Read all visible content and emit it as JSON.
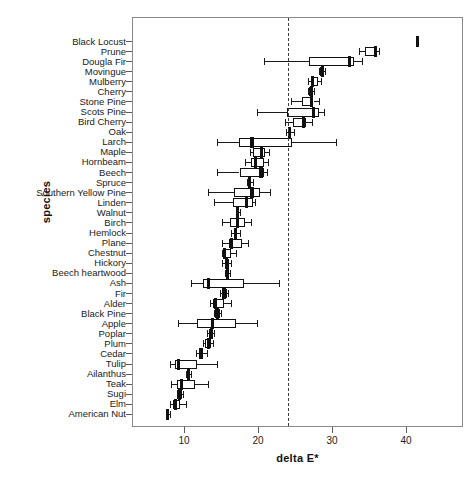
{
  "chart_data": {
    "type": "boxplot",
    "title": "",
    "xlabel": "delta E*",
    "ylabel": "species",
    "xlim": [
      6,
      45.5
    ],
    "xticks": [
      10,
      20,
      30,
      40
    ],
    "xticklabels": [
      "10",
      "20",
      "30",
      "40"
    ],
    "grid": false,
    "legend": null,
    "reference_line": {
      "value": 24,
      "style": "dashed",
      "orientation": "vertical"
    },
    "orientation": "horizontal",
    "categories": [
      "Black Locust",
      "Prune",
      "Dougla Fir",
      "Movingue",
      "Mulberry",
      "Cherry",
      "Stone Pine",
      "Scots Pine",
      "Bird Cherry",
      "Oak",
      "Larch",
      "Maple",
      "Hornbeam",
      "Beech",
      "Spruce",
      "Southern Yellow Pine",
      "Linden",
      "Walnut",
      "Birch",
      "Hemlock",
      "Plane",
      "Chestnut",
      "Hickory",
      "Beech heartwood",
      "Ash",
      "Fir",
      "Alder",
      "Black Pine",
      "Apple",
      "Poplar",
      "Plum",
      "Cedar",
      "Tulip",
      "Ailanthus",
      "Teak",
      "Sugi",
      "Elm",
      "American Nut"
    ],
    "boxes": [
      {
        "species": "Black Locust",
        "whisker_low": 41.3,
        "q1": 41.3,
        "median": 41.5,
        "q3": 41.8,
        "whisker_high": 41.8
      },
      {
        "species": "Prune",
        "whisker_low": 33.6,
        "q1": 34.4,
        "median": 35.9,
        "q3": 36.1,
        "whisker_high": 36.3
      },
      {
        "species": "Dougla Fir",
        "whisker_low": 20.8,
        "q1": 26.9,
        "median": 32.4,
        "q3": 33.0,
        "whisker_high": 34.1
      },
      {
        "species": "Movingue",
        "whisker_low": 28.2,
        "q1": 28.4,
        "median": 28.7,
        "q3": 28.9,
        "whisker_high": 29.0
      },
      {
        "species": "Mulberry",
        "whisker_low": 26.8,
        "q1": 27.2,
        "median": 27.4,
        "q3": 28.1,
        "whisker_high": 28.5
      },
      {
        "species": "Cherry",
        "whisker_low": 26.8,
        "q1": 26.9,
        "median": 27.2,
        "q3": 27.4,
        "whisker_high": 27.5
      },
      {
        "species": "Stone Pine",
        "whisker_low": 24.5,
        "q1": 25.9,
        "median": 27.2,
        "q3": 27.5,
        "whisker_high": 28.2
      },
      {
        "species": "Scots Pine",
        "whisker_low": 19.8,
        "q1": 23.9,
        "median": 27.5,
        "q3": 28.2,
        "whisker_high": 28.9
      },
      {
        "species": "Bird Cherry",
        "whisker_low": 23.7,
        "q1": 24.7,
        "median": 26.1,
        "q3": 26.5,
        "whisker_high": 27.3
      },
      {
        "species": "Oak",
        "whisker_low": 23.8,
        "q1": 24.0,
        "median": 24.3,
        "q3": 24.5,
        "whisker_high": 24.9
      },
      {
        "species": "Larch",
        "whisker_low": 14.5,
        "q1": 17.4,
        "median": 19.2,
        "q3": 24.6,
        "whisker_high": 30.6
      },
      {
        "species": "Maple",
        "whisker_low": 18.9,
        "q1": 19.3,
        "median": 20.5,
        "q3": 20.9,
        "whisker_high": 21.5
      },
      {
        "species": "Hornbeam",
        "whisker_low": 18.3,
        "q1": 19.0,
        "median": 19.7,
        "q3": 20.8,
        "whisker_high": 21.3
      },
      {
        "species": "Beech",
        "whisker_low": 14.4,
        "q1": 17.5,
        "median": 20.4,
        "q3": 20.8,
        "whisker_high": 21.2
      },
      {
        "species": "Spruce",
        "whisker_low": 18.5,
        "q1": 18.7,
        "median": 18.9,
        "q3": 19.1,
        "whisker_high": 19.3
      },
      {
        "species": "Southern Yellow Pine",
        "whisker_low": 13.2,
        "q1": 16.7,
        "median": 19.2,
        "q3": 20.3,
        "whisker_high": 21.6
      },
      {
        "species": "Linden",
        "whisker_low": 14.0,
        "q1": 16.6,
        "median": 18.5,
        "q3": 19.3,
        "whisker_high": 19.6
      },
      {
        "species": "Walnut",
        "whisker_low": 17.0,
        "q1": 17.0,
        "median": 17.2,
        "q3": 17.4,
        "whisker_high": 17.5
      },
      {
        "species": "Birch",
        "whisker_low": 15.1,
        "q1": 16.2,
        "median": 17.2,
        "q3": 18.2,
        "whisker_high": 19.0
      },
      {
        "species": "Hemlock",
        "whisker_low": 16.4,
        "q1": 16.7,
        "median": 17.0,
        "q3": 17.2,
        "whisker_high": 17.6
      },
      {
        "species": "Plane",
        "whisker_low": 15.2,
        "q1": 16.1,
        "median": 16.4,
        "q3": 17.9,
        "whisker_high": 18.6
      },
      {
        "species": "Chestnut",
        "whisker_low": 15.1,
        "q1": 15.3,
        "median": 15.5,
        "q3": 16.3,
        "whisker_high": 17.0
      },
      {
        "species": "Hickory",
        "whisker_low": 15.1,
        "q1": 15.5,
        "median": 15.7,
        "q3": 16.1,
        "whisker_high": 16.3
      },
      {
        "species": "Beech heartwood",
        "whisker_low": 15.6,
        "q1": 15.7,
        "median": 15.9,
        "q3": 16.1,
        "whisker_high": 16.2
      },
      {
        "species": "Ash",
        "whisker_low": 11.0,
        "q1": 12.6,
        "median": 13.3,
        "q3": 18.1,
        "whisker_high": 22.8
      },
      {
        "species": "Fir",
        "whisker_low": 14.9,
        "q1": 15.2,
        "median": 15.4,
        "q3": 15.8,
        "whisker_high": 16.0
      },
      {
        "species": "Alder",
        "whisker_low": 13.5,
        "q1": 13.9,
        "median": 14.3,
        "q3": 15.4,
        "whisker_high": 16.4
      },
      {
        "species": "Black Pine",
        "whisker_low": 14.0,
        "q1": 14.2,
        "median": 14.5,
        "q3": 14.8,
        "whisker_high": 15.0
      },
      {
        "species": "Apple",
        "whisker_low": 9.2,
        "q1": 11.7,
        "median": 13.8,
        "q3": 17.0,
        "whisker_high": 19.9
      },
      {
        "species": "Poplar",
        "whisker_low": 13.1,
        "q1": 13.4,
        "median": 13.7,
        "q3": 13.9,
        "whisker_high": 14.1
      },
      {
        "species": "Plum",
        "whisker_low": 12.6,
        "q1": 12.9,
        "median": 13.3,
        "q3": 13.7,
        "whisker_high": 13.9
      },
      {
        "species": "Cedar",
        "whisker_low": 11.6,
        "q1": 12.0,
        "median": 12.3,
        "q3": 12.6,
        "whisker_high": 13.1
      },
      {
        "species": "Tulip",
        "whisker_low": 8.1,
        "q1": 8.8,
        "median": 9.3,
        "q3": 11.8,
        "whisker_high": 14.5
      },
      {
        "species": "Ailanthus",
        "whisker_low": 10.3,
        "q1": 10.4,
        "median": 10.6,
        "q3": 10.8,
        "whisker_high": 10.9
      },
      {
        "species": "Teak",
        "whisker_low": 8.3,
        "q1": 9.0,
        "median": 9.7,
        "q3": 11.5,
        "whisker_high": 13.3
      },
      {
        "species": "Sugi",
        "whisker_low": 9.0,
        "q1": 9.1,
        "median": 9.4,
        "q3": 9.7,
        "whisker_high": 9.9
      },
      {
        "species": "Elm",
        "whisker_low": 8.1,
        "q1": 8.5,
        "median": 8.9,
        "q3": 9.5,
        "whisker_high": 10.3
      },
      {
        "species": "American Nut",
        "whisker_low": 7.5,
        "q1": 7.6,
        "median": 7.8,
        "q3": 8.0,
        "whisker_high": 8.1
      }
    ]
  }
}
